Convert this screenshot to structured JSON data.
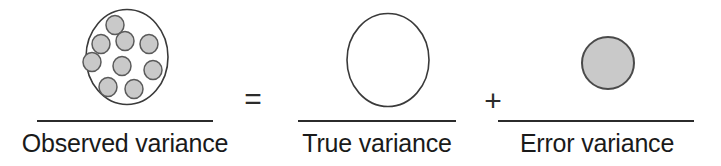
{
  "diagram": {
    "title": "Observed variance = True variance + Error variance",
    "type": "conceptual-equation",
    "background_color": "#ffffff",
    "stroke_color": "#3a3a3a",
    "text_color": "#1a1a1a",
    "terms": [
      {
        "id": "observed",
        "caption": "Observed variance",
        "shape": "circle",
        "shape_name": "observed-variance-circle",
        "fill": "#ffffff",
        "stroke": "#3a3a3a",
        "contents": "scattered-dots",
        "dot_count": 9,
        "dot_fill": "#c9c9c9",
        "dot_stroke": "#5a5a5a"
      },
      {
        "id": "true",
        "caption": "True variance",
        "shape": "circle",
        "shape_name": "true-variance-circle",
        "fill": "#ffffff",
        "stroke": "#3a3a3a",
        "contents": "empty",
        "dot_count": 0
      },
      {
        "id": "error",
        "caption": "Error variance",
        "shape": "circle",
        "shape_name": "error-variance-circle",
        "fill": "#c9c9c9",
        "stroke": "#4a4a4a",
        "contents": "solid-fill",
        "dot_count": 0
      }
    ],
    "operators": [
      {
        "id": "equals",
        "symbol": "="
      },
      {
        "id": "plus",
        "symbol": "+"
      }
    ]
  }
}
